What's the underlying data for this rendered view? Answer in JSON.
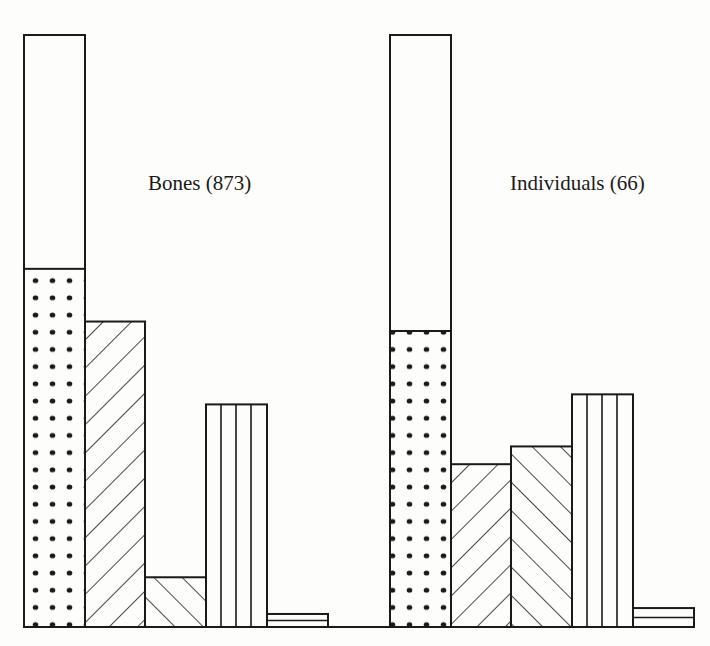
{
  "chart_data": {
    "type": "bar",
    "subtype": "grouped bar with stacked first bar (percentage composition)",
    "title": "",
    "xlabel": "",
    "ylabel": "",
    "ylim": [
      0,
      100
    ],
    "grid": false,
    "legend": "none (categories distinguished by fill pattern)",
    "units": "percent of total (estimated from bar heights; first bar = 100%)",
    "pattern_categories": [
      "total (open)",
      "dotted",
      "forward-hatched",
      "back-hatched",
      "vertical-lined",
      "horizontal-lined"
    ],
    "groups": [
      {
        "label": "Bones (873)",
        "name": "Bones",
        "n": 873,
        "bars": [
          {
            "pattern": "stacked total (open top + dotted bottom)",
            "total": 100,
            "dotted": 60.5
          },
          {
            "pattern": "forward-hatched",
            "value": 51.6
          },
          {
            "pattern": "back-hatched",
            "value": 8.4
          },
          {
            "pattern": "vertical-lined",
            "value": 37.6
          },
          {
            "pattern": "horizontal-lined",
            "value": 2.2
          }
        ]
      },
      {
        "label": "Individuals (66)",
        "name": "Individuals",
        "n": 66,
        "bars": [
          {
            "pattern": "stacked total (open top + dotted bottom)",
            "total": 100,
            "dotted": 50.0
          },
          {
            "pattern": "forward-hatched",
            "value": 27.5
          },
          {
            "pattern": "back-hatched",
            "value": 30.5
          },
          {
            "pattern": "vertical-lined",
            "value": 39.3
          },
          {
            "pattern": "horizontal-lined",
            "value": 3.2
          }
        ]
      }
    ],
    "series": [
      {
        "name": "total (open)",
        "values": [
          100,
          100
        ]
      },
      {
        "name": "dotted",
        "values": [
          60.5,
          50.0
        ]
      },
      {
        "name": "forward-hatched",
        "values": [
          51.6,
          27.5
        ]
      },
      {
        "name": "back-hatched",
        "values": [
          8.4,
          30.5
        ]
      },
      {
        "name": "vertical-lined",
        "values": [
          37.6,
          39.3
        ]
      },
      {
        "name": "horizontal-lined",
        "values": [
          2.2,
          3.2
        ]
      }
    ],
    "categories": [
      "Bones (873)",
      "Individuals (66)"
    ]
  },
  "labels": {
    "bones": "Bones (873)",
    "individuals": "Individuals (66)"
  },
  "colors": {
    "ink": "#1a1a1a",
    "paper": "#fdfdfb"
  }
}
